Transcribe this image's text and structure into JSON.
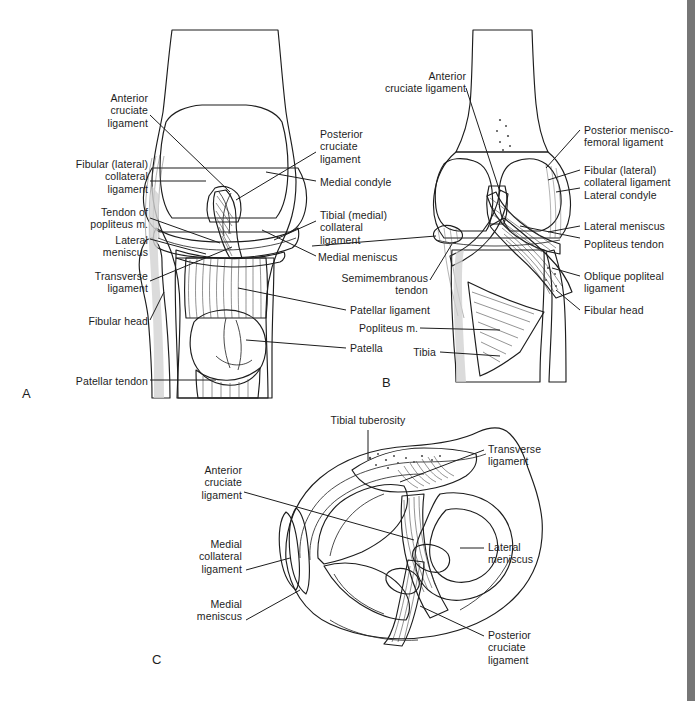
{
  "figure": {
    "background_color": "#ffffff",
    "ink_color": "#1d1d1d",
    "edge_strip_color": "#767676"
  },
  "panels": [
    {
      "id": "A",
      "letter": "A",
      "view": "anterior view of right knee with patella",
      "labels_left": [
        {
          "key": "a_acl",
          "text": "Anterior\ncruciate\nligament"
        },
        {
          "key": "a_fcl",
          "text": "Fibular (lateral)\ncollateral\nligament"
        },
        {
          "key": "a_poplit",
          "text": "Tendon of\npopliteus m."
        },
        {
          "key": "a_latmen",
          "text": "Lateral\nmeniscus"
        },
        {
          "key": "a_transv",
          "text": "Transverse\nligament"
        },
        {
          "key": "a_fibhead",
          "text": "Fibular head"
        },
        {
          "key": "a_pattendon",
          "text": "Patellar tendon"
        }
      ],
      "labels_right": [
        {
          "key": "a_pcl",
          "text": "Posterior\ncruciate\nligament"
        },
        {
          "key": "a_medcond",
          "text": "Medial condyle"
        },
        {
          "key": "a_tcl",
          "text": "Tibial (medial)\ncollateral\nligament"
        },
        {
          "key": "a_medmen",
          "text": "Medial meniscus"
        },
        {
          "key": "a_patlig",
          "text": "Patellar ligament"
        },
        {
          "key": "a_patella",
          "text": "Patella"
        }
      ]
    },
    {
      "id": "B",
      "letter": "B",
      "view": "posterior view of right knee",
      "labels_left": [
        {
          "key": "b_acl",
          "text": "Anterior\ncruciate ligament"
        },
        {
          "key": "b_semimem",
          "text": "Semimembranous\ntendon"
        },
        {
          "key": "b_popm",
          "text": "Popliteus m."
        },
        {
          "key": "b_tibia",
          "text": "Tibia"
        }
      ],
      "labels_right": [
        {
          "key": "b_pmfl",
          "text": "Posterior menisco-\nfemoral ligament"
        },
        {
          "key": "b_fcl",
          "text": "Fibular (lateral)\ncollateral ligament"
        },
        {
          "key": "b_latcond",
          "text": "Lateral condyle"
        },
        {
          "key": "b_latmen",
          "text": "Lateral meniscus"
        },
        {
          "key": "b_poptendon",
          "text": "Popliteus tendon"
        },
        {
          "key": "b_obliq",
          "text": "Oblique popliteal\nligament"
        },
        {
          "key": "b_fibhead",
          "text": "Fibular head"
        }
      ]
    },
    {
      "id": "C",
      "letter": "C",
      "view": "superior view of tibial plateau with menisci",
      "labels_top": [
        {
          "key": "c_tubero",
          "text": "Tibial tuberosity"
        }
      ],
      "labels_left": [
        {
          "key": "c_acl",
          "text": "Anterior\ncruciate\nligament"
        },
        {
          "key": "c_mcl",
          "text": "Medial\ncollateral\nligament"
        },
        {
          "key": "c_medmen",
          "text": "Medial\nmeniscus"
        }
      ],
      "labels_right": [
        {
          "key": "c_transv",
          "text": "Transverse\nligament"
        },
        {
          "key": "c_latmen",
          "text": "Lateral\nmeniscus"
        },
        {
          "key": "c_pcl",
          "text": "Posterior\ncruciate\nligament"
        }
      ]
    }
  ]
}
